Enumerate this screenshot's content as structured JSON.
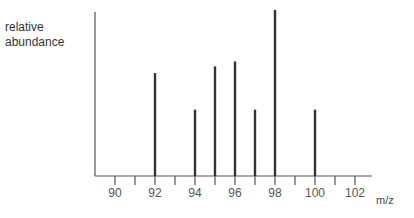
{
  "chart_data": {
    "type": "bar",
    "title": "",
    "xlabel": "m/z",
    "ylabel": "relative abundance",
    "x": [
      92,
      94,
      95,
      96,
      97,
      98,
      100
    ],
    "values": [
      62,
      40,
      66,
      69,
      40,
      100,
      40
    ],
    "xlim": [
      89,
      103
    ],
    "ylim": [
      0,
      100
    ],
    "xticks_major": [
      90,
      92,
      94,
      96,
      98,
      100,
      102
    ],
    "xticks_minor": [
      91,
      93,
      95,
      97,
      99,
      101
    ],
    "grid": false,
    "legend": "none",
    "color": "#333333"
  }
}
